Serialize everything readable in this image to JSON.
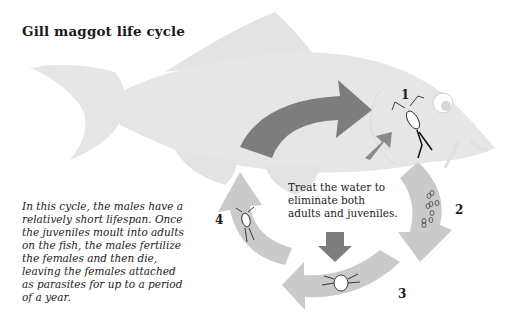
{
  "title": "Gill maggot life cycle",
  "description": "In this cycle, the males have a relatively short lifespan. Once the juveniles moult into adults on the fish, the males fertilize the females and then die, leaving the females attached as parasites for up to a period of a year.",
  "treatment_note": "Treat the water to eliminate both adults and juveniles.",
  "steps": [
    {
      "number": "1",
      "stage": "adult-parasite-on-gill"
    },
    {
      "number": "2",
      "stage": "eggs"
    },
    {
      "number": "3",
      "stage": "larva"
    },
    {
      "number": "4",
      "stage": "juvenile"
    }
  ],
  "colors": {
    "fish": "#e6e6e6",
    "fin_lines": "#d2d2d2",
    "dark_arrow": "#7d7d7d",
    "light_arrow": "#c9c9c9",
    "text": "#222222"
  }
}
